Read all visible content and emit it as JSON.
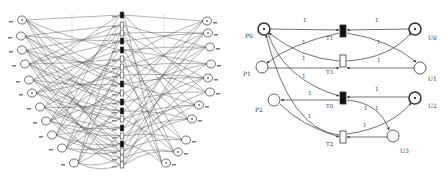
{
  "left_diagram": {
    "description": "Large Petri net with many places and transitions (labels illegible at this resolution)",
    "left_places": [
      {
        "x": 22,
        "y": 20,
        "token": true
      },
      {
        "x": 21,
        "y": 36,
        "token": false
      },
      {
        "x": 22,
        "y": 50,
        "token": false
      },
      {
        "x": 25,
        "y": 64,
        "token": false
      },
      {
        "x": 29,
        "y": 80,
        "token": false
      },
      {
        "x": 32,
        "y": 93,
        "token": true
      },
      {
        "x": 40,
        "y": 107,
        "token": false
      },
      {
        "x": 46,
        "y": 121,
        "token": false
      },
      {
        "x": 52,
        "y": 135,
        "token": false
      },
      {
        "x": 62,
        "y": 148,
        "token": false
      },
      {
        "x": 74,
        "y": 163,
        "token": false
      }
    ],
    "transitions": [
      {
        "y": 15,
        "filled": true
      },
      {
        "y": 25,
        "filled": false
      },
      {
        "y": 33,
        "filled": false
      },
      {
        "y": 41,
        "filled": true
      },
      {
        "y": 50,
        "filled": true
      },
      {
        "y": 59,
        "filled": false
      },
      {
        "y": 67,
        "filled": false
      },
      {
        "y": 75,
        "filled": false
      },
      {
        "y": 84,
        "filled": true
      },
      {
        "y": 93,
        "filled": false
      },
      {
        "y": 102,
        "filled": true
      },
      {
        "y": 111,
        "filled": true
      },
      {
        "y": 119,
        "filled": false
      },
      {
        "y": 128,
        "filled": true
      },
      {
        "y": 136,
        "filled": false
      },
      {
        "y": 144,
        "filled": true
      },
      {
        "y": 151,
        "filled": false
      },
      {
        "y": 158,
        "filled": false
      },
      {
        "y": 165,
        "filled": false
      }
    ],
    "right_places": [
      {
        "x": 207,
        "y": 21,
        "token": true
      },
      {
        "x": 208,
        "y": 33,
        "token": true
      },
      {
        "x": 210,
        "y": 47,
        "token": false
      },
      {
        "x": 211,
        "y": 64,
        "token": false
      },
      {
        "x": 208,
        "y": 78,
        "token": true
      },
      {
        "x": 210,
        "y": 92,
        "token": false
      },
      {
        "x": 199,
        "y": 105,
        "token": true
      },
      {
        "x": 192,
        "y": 119,
        "token": true
      },
      {
        "x": 186,
        "y": 140,
        "token": false
      },
      {
        "x": 178,
        "y": 152,
        "token": true
      },
      {
        "x": 166,
        "y": 163,
        "token": true
      }
    ]
  },
  "right_diagram": {
    "places": [
      {
        "id": "P0",
        "label": "P0",
        "x": 264,
        "y": 29,
        "token": true,
        "lx": 245,
        "ly": 38
      },
      {
        "id": "P1",
        "label": "P1",
        "x": 262,
        "y": 67,
        "token": false,
        "lx": 243,
        "ly": 76
      },
      {
        "id": "P2",
        "label": "P2",
        "x": 274,
        "y": 100,
        "token": false,
        "lx": 255,
        "ly": 112
      },
      {
        "id": "U0",
        "label": "U0",
        "x": 415,
        "y": 29,
        "token": true,
        "lx": 428,
        "ly": 40
      },
      {
        "id": "U1",
        "label": "U1",
        "x": 420,
        "y": 68,
        "token": false,
        "lx": 428,
        "ly": 81
      },
      {
        "id": "U2",
        "label": "U2",
        "x": 415,
        "y": 98,
        "token": true,
        "lx": 428,
        "ly": 108
      },
      {
        "id": "U3",
        "label": "U3",
        "x": 393,
        "y": 136,
        "token": false,
        "lx": 400,
        "ly": 153
      }
    ],
    "transitions": [
      {
        "id": "T1",
        "label": "T1",
        "x": 343,
        "y": 31,
        "filled": true,
        "lx": 326,
        "ly": 40
      },
      {
        "id": "T3",
        "label": "T3",
        "x": 343,
        "y": 61,
        "filled": false,
        "lx": 326,
        "ly": 74
      },
      {
        "id": "T0",
        "label": "T0",
        "x": 343,
        "y": 98,
        "filled": true,
        "lx": 326,
        "ly": 108
      },
      {
        "id": "T2",
        "label": "T2",
        "x": 343,
        "y": 137,
        "filled": false,
        "lx": 326,
        "ly": 146
      }
    ],
    "arc_weight_labels": [
      {
        "text": "1",
        "x": 303,
        "y": 22
      },
      {
        "text": "1",
        "x": 375,
        "y": 22
      },
      {
        "text": "1",
        "x": 302,
        "y": 44
      },
      {
        "text": "1",
        "x": 377,
        "y": 44
      },
      {
        "text": "1",
        "x": 302,
        "y": 60
      },
      {
        "text": "1",
        "x": 377,
        "y": 62
      },
      {
        "text": "1",
        "x": 302,
        "y": 78
      },
      {
        "text": "1",
        "x": 308,
        "y": 95
      },
      {
        "text": "1",
        "x": 375,
        "y": 91
      },
      {
        "text": "1",
        "x": 364,
        "y": 110
      },
      {
        "text": "1",
        "x": 375,
        "y": 110
      },
      {
        "text": "1",
        "x": 308,
        "y": 118
      },
      {
        "text": "1",
        "x": 363,
        "y": 127
      }
    ]
  },
  "colors": {
    "stroke": "#333333",
    "fill_transition": "#111111",
    "background": "#ffffff"
  }
}
